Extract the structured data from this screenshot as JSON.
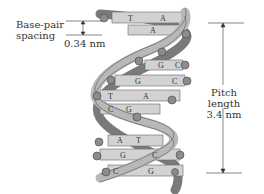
{
  "diagram": {
    "annotations": {
      "base_pair_spacing": {
        "label": "Base-pair\nspacing",
        "label_line1": "Base-pair",
        "label_line2": "spacing",
        "value": "0.34 nm"
      },
      "pitch_length": {
        "label": "Pitch length",
        "value": "3.4 nm"
      }
    },
    "base_pairs": [
      {
        "left": "T",
        "right": "A",
        "y": 18
      },
      {
        "left": "",
        "right": "A",
        "y": 31
      },
      {
        "left": "G",
        "right": "C",
        "y": 66
      },
      {
        "left": "G",
        "right": "C",
        "y": 81
      },
      {
        "left": "T",
        "right": "A",
        "y": 96
      },
      {
        "left": "C",
        "right": "G",
        "y": 110
      },
      {
        "left": "A",
        "right": "T",
        "y": 141
      },
      {
        "left": "G",
        "right": "C",
        "y": 155
      },
      {
        "left": "C",
        "right": "G",
        "y": 172
      }
    ],
    "colors": {
      "strand_dark": "#7a7a7a",
      "strand_light": "#b8b8b8",
      "base_pair_fill": "#d2d2d2",
      "phosphate": "#8c8c8c",
      "text": "#333333"
    }
  }
}
